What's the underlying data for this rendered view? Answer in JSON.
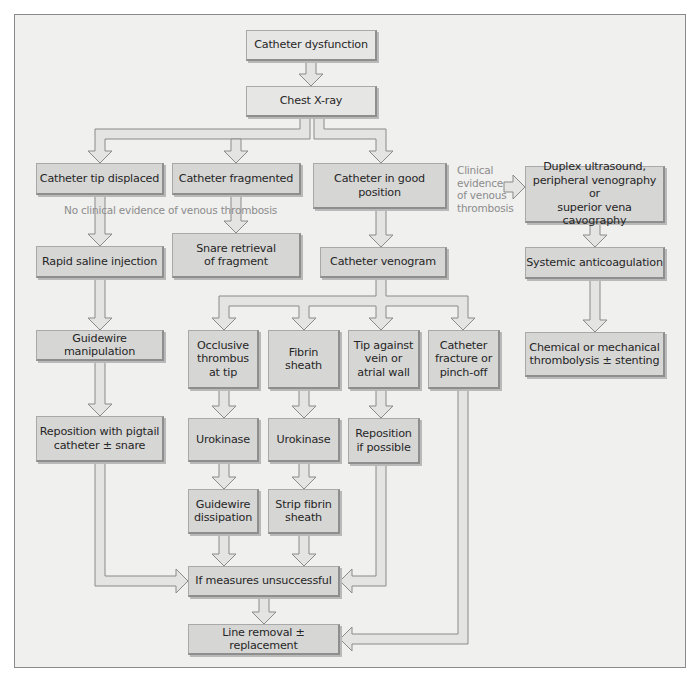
{
  "diagram": {
    "type": "flowchart",
    "title_visible": false,
    "colors": {
      "background": "#f0f0ef",
      "box_fill": "#d6d6d5",
      "box_fill_light": "#e6e6e5",
      "box_border": "#8e8e8e",
      "arrow_fill": "#e4e4e3",
      "arrow_stroke": "#8a8a8a",
      "note_text": "#8c8c8c",
      "box_text": "#262626"
    },
    "nodes": {
      "catheter_dysfunction": "Catheter dysfunction",
      "chest_xray": "Chest X-ray",
      "tip_displaced": "Catheter tip displaced",
      "fragmented": "Catheter fragmented",
      "good_position": "Catheter in good\nposition",
      "duplex": "Duplex ultrasound,\nperipheral venography or\nsuperior vena cavography",
      "rapid_saline": "Rapid saline injection",
      "snare_retrieval": "Snare retrieval\nof fragment",
      "venogram": "Catheter venogram",
      "systemic_anticoag": "Systemic anticoagulation",
      "guidewire_manipulation": "Guidewire manipulation",
      "occlusive_thrombus": "Occlusive\nthrombus\nat tip",
      "fibrin_sheath": "Fibrin\nsheath",
      "tip_against_wall": "Tip against\nvein or\natrial wall",
      "fracture_pinchoff": "Catheter\nfracture or\npinch-off",
      "thrombolysis": "Chemical or mechanical\nthrombolysis ± stenting",
      "reposition_pigtail": "Reposition with pigtail\ncatheter ± snare",
      "urokinase_1": "Urokinase",
      "urokinase_2": "Urokinase",
      "reposition_possible": "Reposition\nif possible",
      "guidewire_dissipation": "Guidewire\ndissipation",
      "strip_fibrin": "Strip fibrin\nsheath",
      "measures_unsuccessful": "If measures unsuccessful",
      "line_removal": "Line removal ± replacement"
    },
    "annotations": {
      "no_thrombosis": "No clinical evidence of venous thrombosis",
      "clinical_evidence": "Clinical\nevidence\nof venous\nthrombosis"
    },
    "edges": [
      [
        "catheter_dysfunction",
        "chest_xray"
      ],
      [
        "chest_xray",
        "tip_displaced"
      ],
      [
        "chest_xray",
        "fragmented"
      ],
      [
        "chest_xray",
        "good_position"
      ],
      [
        "good_position",
        "duplex",
        "Clinical evidence of venous thrombosis"
      ],
      [
        "tip_displaced",
        "rapid_saline",
        "No clinical evidence of venous thrombosis"
      ],
      [
        "fragmented",
        "snare_retrieval",
        "No clinical evidence of venous thrombosis"
      ],
      [
        "good_position",
        "venogram"
      ],
      [
        "duplex",
        "systemic_anticoag"
      ],
      [
        "systemic_anticoag",
        "thrombolysis"
      ],
      [
        "rapid_saline",
        "guidewire_manipulation"
      ],
      [
        "guidewire_manipulation",
        "reposition_pigtail"
      ],
      [
        "venogram",
        "occlusive_thrombus"
      ],
      [
        "venogram",
        "fibrin_sheath"
      ],
      [
        "venogram",
        "tip_against_wall"
      ],
      [
        "venogram",
        "fracture_pinchoff"
      ],
      [
        "occlusive_thrombus",
        "urokinase_1"
      ],
      [
        "fibrin_sheath",
        "urokinase_2"
      ],
      [
        "tip_against_wall",
        "reposition_possible"
      ],
      [
        "urokinase_1",
        "guidewire_dissipation"
      ],
      [
        "urokinase_2",
        "strip_fibrin"
      ],
      [
        "reposition_pigtail",
        "measures_unsuccessful"
      ],
      [
        "guidewire_dissipation",
        "measures_unsuccessful"
      ],
      [
        "strip_fibrin",
        "measures_unsuccessful"
      ],
      [
        "reposition_possible",
        "measures_unsuccessful"
      ],
      [
        "measures_unsuccessful",
        "line_removal"
      ],
      [
        "fracture_pinchoff",
        "line_removal"
      ]
    ]
  }
}
